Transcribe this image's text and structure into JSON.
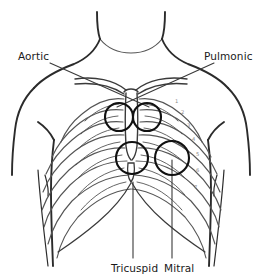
{
  "diagram": {
    "colors": {
      "body_outline": "#2b2b2b",
      "rib_outline": "#555555",
      "marker_circle": "#111111",
      "leader_line": "#3a3a3a",
      "label_text": "#1a1a1a",
      "background": "#ffffff"
    },
    "labels": {
      "aortic": "Aortic",
      "pulmonic": "Pulmonic",
      "tricuspid": "Tricuspid",
      "mitral": "Mitral"
    },
    "markers": [
      {
        "name": "aortic",
        "cx": 119,
        "cy": 117,
        "r": 14
      },
      {
        "name": "pulmonic",
        "cx": 147,
        "cy": 117,
        "r": 14
      },
      {
        "name": "tricuspid",
        "cx": 132,
        "cy": 158,
        "r": 16
      },
      {
        "name": "mitral",
        "cx": 172,
        "cy": 158,
        "r": 17
      }
    ],
    "rib_numbers": [
      "1",
      "2",
      "3",
      "4",
      "5",
      "6",
      "7"
    ]
  }
}
